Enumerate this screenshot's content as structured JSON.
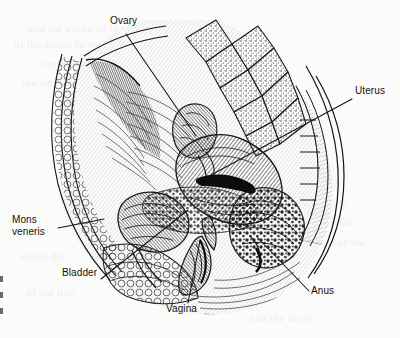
{
  "figure": {
    "style": "black-and-white engraved line and stipple anatomical illustration",
    "background_color": "#fbfbfa",
    "ink_color": "#111111",
    "leader_line_color": "#1a1a1a"
  },
  "labels": [
    {
      "id": "ovary",
      "text": "Ovary",
      "x": 110,
      "y": 22,
      "align": "left",
      "leader": {
        "from_x": 126,
        "from_y": 34,
        "to_x": 196,
        "to_y": 136
      }
    },
    {
      "id": "uterus",
      "text": "Uterus",
      "x": 355,
      "y": 92,
      "align": "left",
      "leader": {
        "from_x": 352,
        "from_y": 99,
        "to_x": 211,
        "to_y": 175
      }
    },
    {
      "id": "mons-veneris",
      "line1": "Mons",
      "line2": "veneris",
      "text": "Mons veneris",
      "x": 26,
      "y": 221,
      "align": "left",
      "leader": {
        "from_x": 58,
        "from_y": 228,
        "to_x": 104,
        "to_y": 219
      }
    },
    {
      "id": "bladder",
      "text": "Bladder",
      "x": 62,
      "y": 273,
      "align": "left",
      "leader": {
        "from_x": 101,
        "from_y": 279,
        "to_x": 188,
        "to_y": 210
      }
    },
    {
      "id": "vagina",
      "text": "Vagina",
      "x": 166,
      "y": 308,
      "align": "left",
      "leader": {
        "from_x": 188,
        "from_y": 303,
        "to_x": 200,
        "to_y": 241
      }
    },
    {
      "id": "anus",
      "text": "Anus",
      "x": 311,
      "y": 290,
      "align": "left",
      "leader": {
        "from_x": 309,
        "from_y": 291,
        "to_x": 257,
        "to_y": 237
      }
    }
  ],
  "structures": [
    {
      "id": "sacrum-vertebrae",
      "name": "sacral vertebrae with cancellous bone stipple"
    },
    {
      "id": "uterus-body",
      "name": "uterus"
    },
    {
      "id": "ovary-body",
      "name": "ovary"
    },
    {
      "id": "bladder-body",
      "name": "urinary bladder"
    },
    {
      "id": "vagina-canal",
      "name": "vagina"
    },
    {
      "id": "rectum-anus",
      "name": "rectum and anus"
    },
    {
      "id": "mons-pad",
      "name": "mons veneris fatty pad"
    },
    {
      "id": "abdominal-wall",
      "name": "anterior abdominal wall"
    }
  ],
  "page_showthrough": {
    "note": "faint ghost text bleeding through from the reverse side of the page",
    "lines": [
      "and the entire of the",
      "of the tissue in the",
      "common of the tract",
      "the smooth lining",
      "Connective",
      "Tissue of",
      "the region",
      "remains in the",
      "surface of the",
      "under the",
      "of the line",
      "and the most"
    ]
  }
}
